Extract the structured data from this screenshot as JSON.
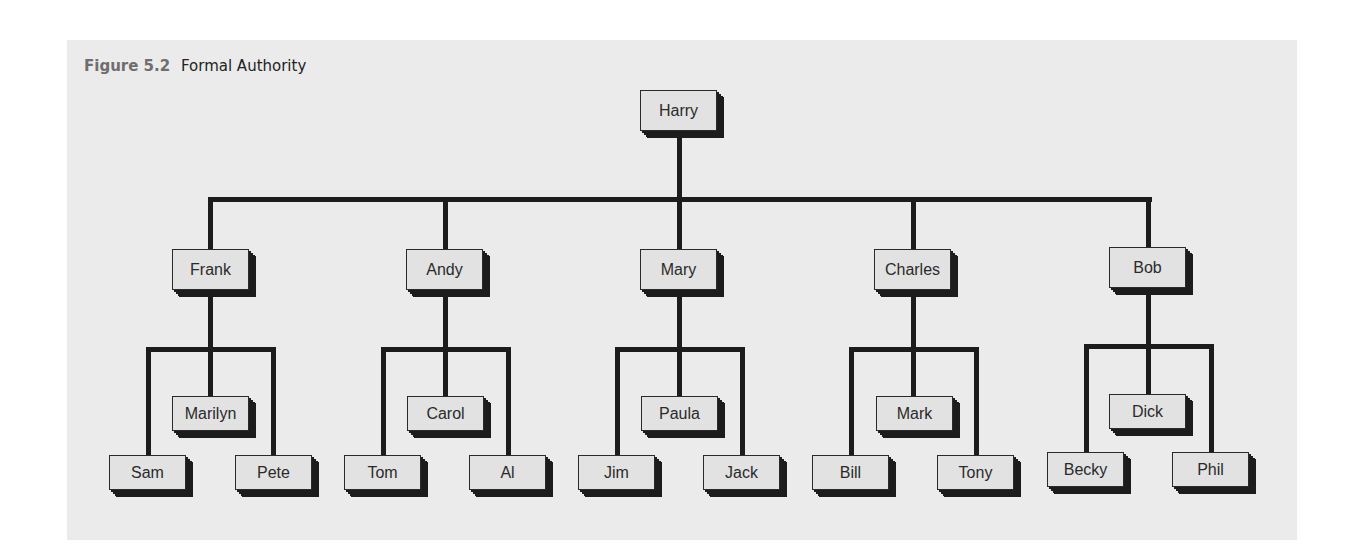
{
  "caption": {
    "figure_label": "Figure 5.2",
    "title": "Formal Authority"
  },
  "colors": {
    "panel_background": "#ebebeb",
    "box_fill": "#e2e2e2",
    "line": "#1c1c1c"
  },
  "org_chart": {
    "root": "Harry",
    "managers": [
      {
        "name": "Frank",
        "reports": [
          "Sam",
          "Marilyn",
          "Pete"
        ]
      },
      {
        "name": "Andy",
        "reports": [
          "Tom",
          "Carol",
          "Al"
        ]
      },
      {
        "name": "Mary",
        "reports": [
          "Jim",
          "Paula",
          "Jack"
        ]
      },
      {
        "name": "Charles",
        "reports": [
          "Bill",
          "Mark",
          "Tony"
        ]
      },
      {
        "name": "Bob",
        "reports": [
          "Becky",
          "Dick",
          "Phil"
        ]
      }
    ]
  }
}
